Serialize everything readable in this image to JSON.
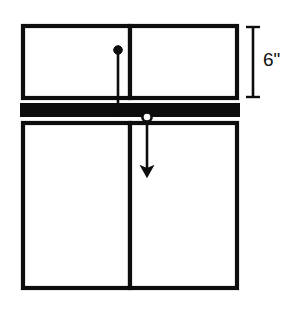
{
  "diagram": {
    "stroke_color": "#0d0d0d",
    "fill_color": "#ffffff",
    "bar_color": "#0d0d0d",
    "background_color": "#ffffff",
    "dimension": {
      "label": "6\"",
      "value": 6,
      "unit": "inch",
      "measures": "height of upper panel assembly",
      "orientation": "vertical",
      "position": "right"
    },
    "shapes": [
      {
        "name": "upper-panel-left",
        "type": "rectangle",
        "x": 23,
        "y": 26,
        "width": 107,
        "height": 72
      },
      {
        "name": "upper-panel-right",
        "type": "rectangle",
        "x": 130,
        "y": 26,
        "width": 107,
        "height": 72
      },
      {
        "name": "solid-bar",
        "type": "filled-rectangle",
        "x": 20,
        "y": 103,
        "width": 220,
        "height": 14
      },
      {
        "name": "lower-panel-left",
        "type": "rectangle",
        "x": 23,
        "y": 123,
        "width": 107,
        "height": 165
      },
      {
        "name": "lower-panel-right",
        "type": "rectangle",
        "x": 130,
        "y": 123,
        "width": 107,
        "height": 165
      }
    ],
    "arrows": [
      {
        "name": "upper-load-arrow",
        "marker": "filled-dot",
        "x": 118,
        "y_start": 50,
        "y_end": 114,
        "direction": "down"
      },
      {
        "name": "lower-load-arrow",
        "marker": "hollow-dot",
        "x": 147,
        "y_start": 117,
        "y_end": 176,
        "direction": "down"
      }
    ]
  }
}
